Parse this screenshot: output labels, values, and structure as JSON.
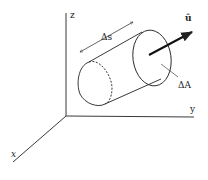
{
  "diagram": {
    "axes": {
      "x_label": "x",
      "y_label": "y",
      "z_label": "z"
    },
    "labels": {
      "length": "Δs",
      "area": "ΔA",
      "unit_vector": "û"
    },
    "colors": {
      "stroke": "#222222",
      "background": "#ffffff"
    }
  }
}
